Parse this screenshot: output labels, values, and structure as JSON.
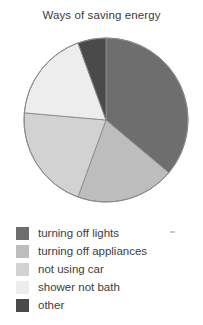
{
  "chart_data": {
    "type": "pie",
    "title": "Ways of saving energy",
    "xlabel": "",
    "ylabel": "",
    "legend_position": "bottom-left",
    "start_angle_deg": 0,
    "direction": "clockwise",
    "categories": [
      "turning off lights",
      "turning off appliances",
      "not using car",
      "shower not bath",
      "other"
    ],
    "values": [
      36,
      19,
      21,
      18,
      6
    ],
    "slices": [
      {
        "label": "turning off lights",
        "percent": 36,
        "start_deg": 0,
        "end_deg": 130,
        "color": "#6e6e6e"
      },
      {
        "label": "turning off appliances",
        "percent": 19,
        "start_deg": 130,
        "end_deg": 200,
        "color": "#bdbdbd"
      },
      {
        "label": "not using car",
        "percent": 21,
        "start_deg": 200,
        "end_deg": 275,
        "color": "#d2d2d2"
      },
      {
        "label": "shower not bath",
        "percent": 18,
        "start_deg": 275,
        "end_deg": 340,
        "color": "#ededed"
      },
      {
        "label": "other",
        "percent": 6,
        "start_deg": 340,
        "end_deg": 360,
        "color": "#4a4a4a"
      }
    ],
    "geometry": {
      "center_x": 106,
      "center_y": 120,
      "radius": 82,
      "outline_color": "#8a8a8a"
    }
  },
  "legend": {
    "items": [
      {
        "label": "turning off lights",
        "color": "#6e6e6e"
      },
      {
        "label": "turning off appliances",
        "color": "#bdbdbd"
      },
      {
        "label": "not using car",
        "color": "#d2d2d2"
      },
      {
        "label": "shower not bath",
        "color": "#ededed"
      },
      {
        "label": "other",
        "color": "#4a4a4a"
      }
    ]
  }
}
